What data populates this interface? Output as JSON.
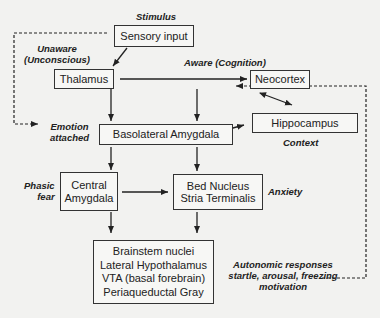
{
  "diagram": {
    "nodes": {
      "sensory_input": {
        "label": "Sensory input"
      },
      "thalamus": {
        "label": "Thalamus"
      },
      "neocortex": {
        "label": "Neocortex"
      },
      "basolateral_amygdala": {
        "label": "Basolateral Amygdala"
      },
      "hippocampus": {
        "label": "Hippocampus"
      },
      "central_amygdala": {
        "line1": "Central",
        "line2": "Amygdala"
      },
      "bed_nucleus": {
        "line1": "Bed Nucleus",
        "line2": "Stria Terminalis"
      },
      "outputs": {
        "line1": "Brainstem nuclei",
        "line2": "Lateral Hypothalamus",
        "line3": "VTA (basal forebrain)",
        "line4": "Periaqueductal Gray"
      }
    },
    "annotations": {
      "stimulus": "Stimulus",
      "unaware_line1": "Unaware",
      "unaware_line2": "(Unconscious)",
      "aware": "Aware (Cognition)",
      "emotion_line1": "Emotion",
      "emotion_line2": "attached",
      "context": "Context",
      "phasic_line1": "Phasic",
      "phasic_line2": "fear",
      "anxiety": "Anxiety",
      "autonomic_line1": "Autonomic responses",
      "autonomic_line2": "startle, arousal, freezing",
      "autonomic_line3": "motivation"
    },
    "edges": [
      {
        "from": "Sensory input",
        "to": "Thalamus",
        "style": "solid"
      },
      {
        "from": "Thalamus",
        "to": "Neocortex",
        "style": "solid"
      },
      {
        "from": "Thalamus",
        "to": "Basolateral Amygdala",
        "style": "solid"
      },
      {
        "from": "Neocortex",
        "to": "Basolateral Amygdala",
        "style": "solid"
      },
      {
        "from": "Neocortex",
        "to": "Hippocampus",
        "style": "solid-bidirectional"
      },
      {
        "from": "Basolateral Amygdala",
        "to": "Hippocampus",
        "style": "solid-bidirectional"
      },
      {
        "from": "Basolateral Amygdala",
        "to": "Central Amygdala",
        "style": "solid"
      },
      {
        "from": "Basolateral Amygdala",
        "to": "Bed Nucleus Stria Terminalis",
        "style": "solid"
      },
      {
        "from": "Central Amygdala",
        "to": "Bed Nucleus Stria Terminalis",
        "style": "solid"
      },
      {
        "from": "Central Amygdala",
        "to": "Brainstem/Hypothalamus outputs",
        "style": "solid"
      },
      {
        "from": "Bed Nucleus Stria Terminalis",
        "to": "Brainstem/Hypothalamus outputs",
        "style": "solid"
      },
      {
        "from": "Sensory input",
        "to": "Emotion attached",
        "style": "dashed"
      },
      {
        "from": "Autonomic responses",
        "to": "Neocortex",
        "style": "dashed"
      }
    ]
  }
}
